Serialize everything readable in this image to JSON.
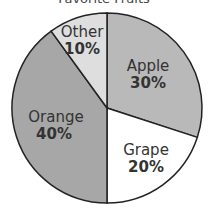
{
  "chart_data": {
    "type": "pie",
    "title": "Favorite Fruits",
    "categories": [
      "Apple",
      "Grape",
      "Orange",
      "Other"
    ],
    "values": [
      30,
      20,
      40,
      10
    ],
    "labels": [
      "30%",
      "20%",
      "40%",
      "10%"
    ],
    "colors": [
      "#b9b9b9",
      "#ffffff",
      "#a7a7a7",
      "#dedede"
    ],
    "start_angle_deg": 0,
    "direction": "clockwise",
    "legend": "none"
  },
  "title": "Favorite Fruits",
  "slices": [
    {
      "name": "Apple",
      "pct": "30%"
    },
    {
      "name": "Grape",
      "pct": "20%"
    },
    {
      "name": "Orange",
      "pct": "40%"
    },
    {
      "name": "Other",
      "pct": "10%"
    }
  ]
}
